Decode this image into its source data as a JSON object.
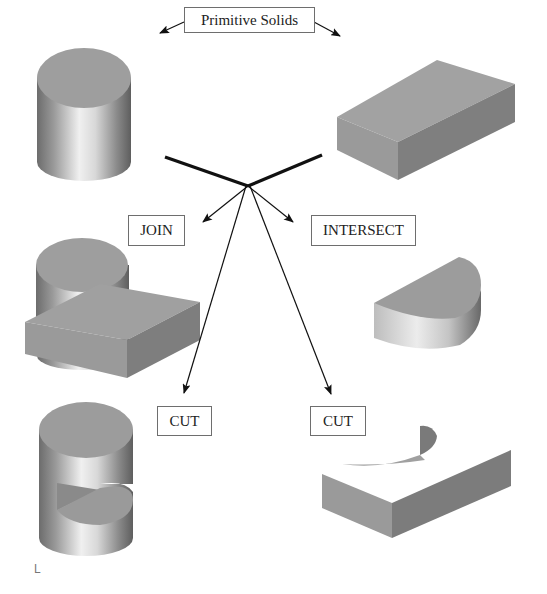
{
  "title": "Primitive Solids",
  "labels": {
    "primitive_solids": "Primitive Solids",
    "join": "JOIN",
    "intersect": "INTERSECT",
    "cut_left": "CUT",
    "cut_right": "CUT"
  },
  "solids": [
    {
      "id": "primitive-cylinder",
      "description": "Cylinder primitive"
    },
    {
      "id": "primitive-box",
      "description": "Rectangular block primitive"
    },
    {
      "id": "join-result",
      "description": "Cylinder joined with block"
    },
    {
      "id": "intersect-result",
      "description": "Half-cylinder intersection"
    },
    {
      "id": "cut-cylinder-result",
      "description": "Cylinder with block cut out"
    },
    {
      "id": "cut-block-result",
      "description": "Block with cylindrical cut-out"
    }
  ],
  "corner_mark": "L",
  "colors": {
    "background": "#ffffff",
    "line": "#111111",
    "box_border": "#6e6e6e",
    "solid_top": "#9a9a9a",
    "solid_side_dark": "#7d7d7d",
    "solid_side_light": "#a3a3a3",
    "cyl_highlight": "#f2f2f2",
    "cyl_shadow": "#6a6a6a"
  }
}
